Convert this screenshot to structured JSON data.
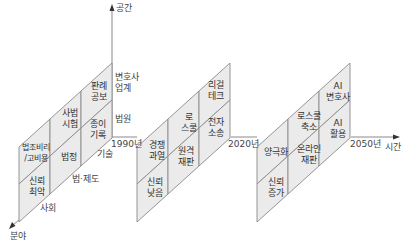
{
  "colors": {
    "cell_fill": "#ebebeb",
    "line": "#8a8a8a",
    "text": "#333333"
  },
  "axes": {
    "vertical": "공간",
    "horizontal": "시간",
    "diagonal": "분야"
  },
  "space_labels": {
    "lawyers": "변호사\n업계",
    "court": "법원"
  },
  "field_labels": {
    "tech": "기술",
    "law": "법·제도",
    "society": "사회"
  },
  "years": [
    "1990년",
    "2020년",
    "2050년"
  ],
  "panels": [
    {
      "year": "1990년",
      "cells": {
        "society_top": "법조비리\n/고비용",
        "society_bottom": "신뢰\n최악",
        "law_top": "사법\n시험",
        "law_bottom": "법정",
        "tech_top": "판례\n공보",
        "tech_bottom": "종이\n기록"
      }
    },
    {
      "year": "2020년",
      "cells": {
        "society_top": "경쟁\n과열",
        "society_bottom": "신뢰\n낮음",
        "law_top": "로\n스쿨",
        "law_bottom": "원격\n재판",
        "tech_top": "리걸\n테크",
        "tech_bottom": "전자\n소송"
      }
    },
    {
      "year": "2050년",
      "cells": {
        "society_top": "양극화",
        "society_bottom": "신뢰\n증가",
        "law_top": "로스쿨\n축소",
        "law_bottom": "온라인\n재판",
        "tech_top": "AI\n변호사",
        "tech_bottom": "AI\n활용"
      }
    }
  ]
}
